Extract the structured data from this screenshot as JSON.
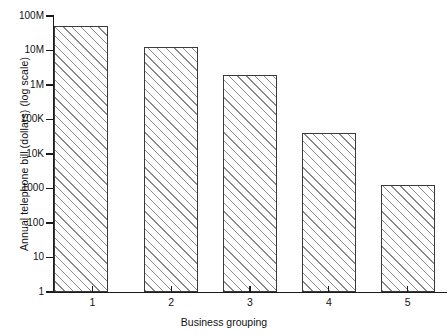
{
  "chart_data": {
    "type": "bar",
    "title": "",
    "subtitle": "",
    "xlabel": "Business grouping",
    "ylabel": "Annual telephone bill (dollars) (log scale)",
    "categories": [
      "1",
      "2",
      "3",
      "4",
      "5"
    ],
    "values": [
      50000000,
      13000000,
      2000000,
      40000,
      1300
    ],
    "value_labels": [
      "50M",
      "13M",
      "2M",
      "40K",
      "1300"
    ],
    "yscale": "log",
    "ylim": [
      1,
      100000000
    ],
    "ytick_values": [
      1,
      10,
      100,
      1000,
      10000,
      100000,
      1000000,
      10000000,
      100000000
    ],
    "ytick_labels": [
      "1",
      "10",
      "100",
      "1000",
      "10K",
      "100K",
      "1M",
      "10M",
      "100M"
    ],
    "xtick_labels": [
      "1",
      "2",
      "3",
      "4",
      "5"
    ],
    "grid": false,
    "legend": null,
    "bar_fill": "hatched-diagonal-45",
    "bar_edge_color": "#3a3a3a",
    "hatch_color": "#8a8a8a",
    "background": "#ffffff",
    "annotations": []
  },
  "axis": {
    "y_title": "Annual telephone bill (dollars) (log scale)",
    "x_title": "Business grouping"
  }
}
